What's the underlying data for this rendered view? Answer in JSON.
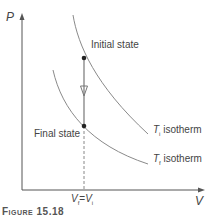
{
  "figure": {
    "caption": "Figure 15.18",
    "axes": {
      "y_label": "P",
      "x_label": "V"
    },
    "states": {
      "initial": "Initial state",
      "final": "Final state"
    },
    "isotherms": {
      "upper": {
        "symbol": "T",
        "subscript": "i",
        "label": "isotherm"
      },
      "lower": {
        "symbol": "T",
        "subscript": "f",
        "label": "isotherm"
      }
    },
    "volume_marker": {
      "left_symbol": "V",
      "left_subscript": "f",
      "equals": "=",
      "right_symbol": "V",
      "right_subscript": "i"
    },
    "colors": {
      "axis": "#555555",
      "curve": "#888888",
      "process_line": "#777777",
      "dot": "#222222"
    }
  }
}
